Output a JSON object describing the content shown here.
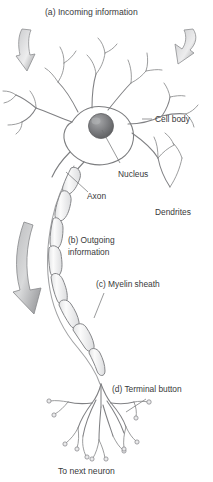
{
  "figure": {
    "background_color": "#ffffff",
    "line_color": "#808184",
    "text_color": "#38393b"
  },
  "labels": {
    "incoming": "(a) Incoming information",
    "cell_body": "Cell body",
    "nucleus": "Nucleus",
    "axon": "Axon",
    "dendrites": "Dendrites",
    "outgoing_line1": "(b) Outgoing",
    "outgoing_line2": "information",
    "myelin": "(c) Myelin sheath",
    "terminal": "(d) Terminal button",
    "next_neuron": "To next neuron"
  },
  "parts": [
    {
      "key": "dendrites",
      "name": "Dendrites",
      "marker": ""
    },
    {
      "key": "cell_body",
      "name": "Cell body",
      "marker": ""
    },
    {
      "key": "nucleus",
      "name": "Nucleus",
      "marker": ""
    },
    {
      "key": "axon",
      "name": "Axon",
      "marker": ""
    },
    {
      "key": "myelin_sheath",
      "name": "Myelin sheath",
      "marker": "(c)"
    },
    {
      "key": "terminal_button",
      "name": "Terminal button",
      "marker": "(d)"
    }
  ],
  "flow": [
    {
      "key": "incoming",
      "marker": "(a)",
      "name": "Incoming information",
      "direction": "into dendrites"
    },
    {
      "key": "outgoing",
      "marker": "(b)",
      "name": "Outgoing information",
      "direction": "down the axon"
    }
  ]
}
